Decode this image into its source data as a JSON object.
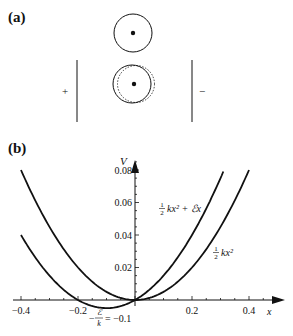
{
  "panel_a": {
    "label": "(a)",
    "plus": "+",
    "minus": "−"
  },
  "panel_b": {
    "label": "(b)"
  },
  "chart_data": {
    "type": "line",
    "title": "",
    "xlabel": "x",
    "ylabel": "V",
    "xlim": [
      -0.4,
      0.45
    ],
    "ylim": [
      -0.005,
      0.09
    ],
    "x_ticks": [
      "-0.4",
      "-0.2",
      "0.2",
      "0.4"
    ],
    "y_ticks": [
      "0.02",
      "0.04",
      "0.06",
      "0.08"
    ],
    "grid": false,
    "series": [
      {
        "name": "½kx² + ℰx",
        "label_num": "1",
        "label_den": "2",
        "label_rest": "kx² + ℰx",
        "formula": "0.5*x^2 + 0.1*x",
        "x_range": [
          -0.4,
          0.31
        ],
        "x": [
          -0.4,
          -0.3,
          -0.2,
          -0.1,
          0.0,
          0.1,
          0.2,
          0.3
        ],
        "values": [
          0.04,
          0.015,
          0.0,
          -0.005,
          0.0,
          0.015,
          0.04,
          0.075
        ]
      },
      {
        "name": "½kx²",
        "label_num": "1",
        "label_den": "2",
        "label_rest": "kx²",
        "formula": "0.5*x^2",
        "x_range": [
          -0.4,
          0.4
        ],
        "x": [
          -0.4,
          -0.3,
          -0.2,
          -0.1,
          0.0,
          0.1,
          0.2,
          0.3,
          0.4
        ],
        "values": [
          0.08,
          0.045,
          0.02,
          0.005,
          0.0,
          0.005,
          0.02,
          0.045,
          0.08
        ]
      }
    ],
    "annotations": [
      {
        "text": "−ℰ/k = −0.1",
        "prefix": "−",
        "num": "ℰ",
        "den": "k",
        "suffix": "= −0.1",
        "x": -0.1
      }
    ]
  }
}
